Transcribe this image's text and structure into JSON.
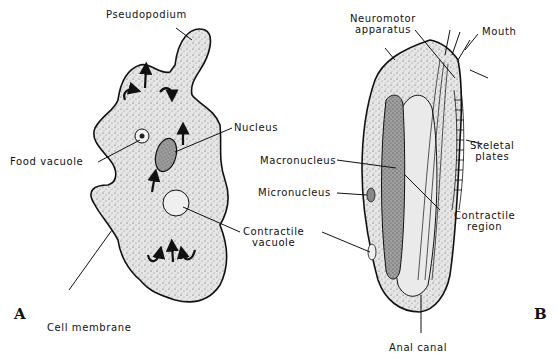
{
  "figure": {
    "panel_a": {
      "letter": "A",
      "organism": "amoeba",
      "labels": {
        "pseudopodium": "Pseudopodium",
        "nucleus": "Nucleus",
        "food_vacuole": "Food vacuole",
        "contractile_vacuole_1": "Contractile",
        "contractile_vacuole_2": "vacuole",
        "cell_membrane": "Cell membrane"
      }
    },
    "panel_b": {
      "letter": "B",
      "organism": "ciliate",
      "labels": {
        "neuromotor_1": "Neuromotor",
        "neuromotor_2": "apparatus",
        "mouth": "Mouth",
        "skeletal_1": "Skeletal",
        "skeletal_2": "plates",
        "macronucleus": "Macronucleus",
        "micronucleus": "Micronucleus",
        "contractile_region_1": "Contractile",
        "contractile_region_2": "region",
        "anal_canal": "Anal canal"
      }
    },
    "colors": {
      "ink": "#111111",
      "cytoplasm": "#e4e4e4",
      "macronucleus": "#9a9a9a",
      "background": "#ffffff"
    }
  }
}
